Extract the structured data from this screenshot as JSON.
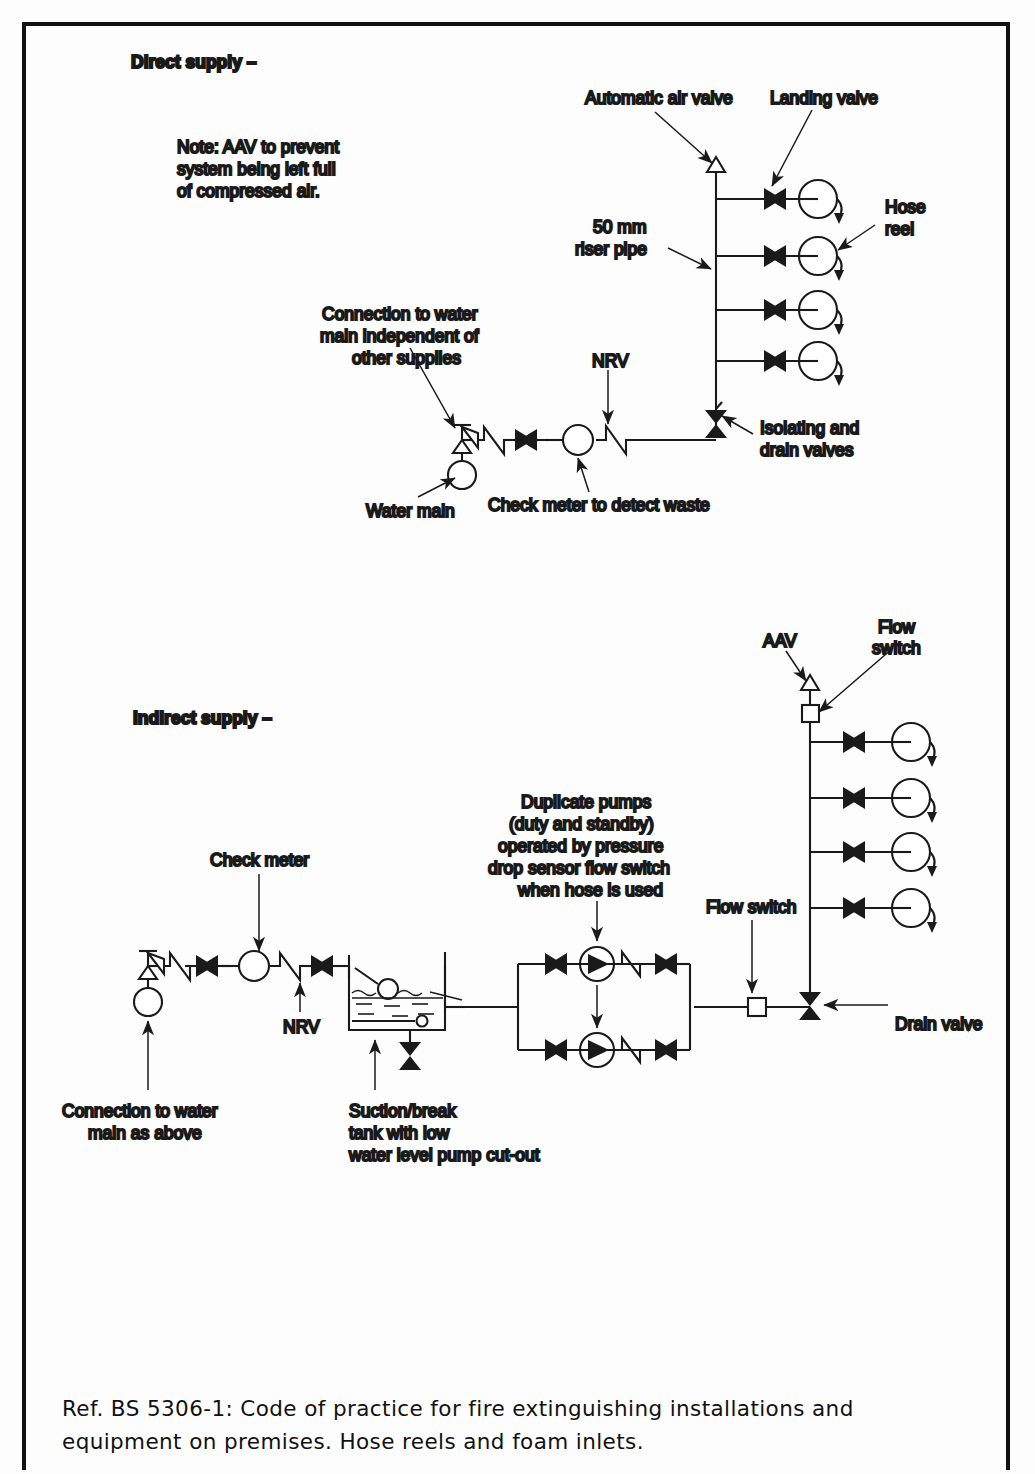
{
  "document": {
    "caption_line1": "Ref. BS 5306-1: Code of practice for fire extinguishing installations and",
    "caption_line2": "equipment on premises. Hose reels and foam inlets."
  },
  "diagram_direct": {
    "title": "Direct supply –",
    "note_line1": "Note: AAV to prevent",
    "note_line2": "system being left full",
    "note_line3": "of compressed air.",
    "label_aav": "Automatic air valve",
    "label_landing_valve": "Landing valve",
    "label_hose_reel_1": "Hose",
    "label_hose_reel_2": "reel",
    "label_riser_1": "50 mm",
    "label_riser_2": "riser pipe",
    "label_nrv": "NRV",
    "label_connection_1": "Connection to water",
    "label_connection_2": "main independent of",
    "label_connection_3": "other supplies",
    "label_water_main": "Water main",
    "label_check_meter": "Check meter to detect waste",
    "label_isolating_1": "Isolating and",
    "label_isolating_2": "drain valves",
    "hose_reel_count": 4
  },
  "diagram_indirect": {
    "title": "Indirect supply –",
    "label_aav": "AAV",
    "label_flow_switch_top_1": "Flow",
    "label_flow_switch_top_2": "switch",
    "label_flow_switch_mid": "Flow switch",
    "label_check_meter": "Check meter",
    "label_pumps_1": "Duplicate pumps",
    "label_pumps_2": "(duty and standby)",
    "label_pumps_3": "operated by pressure",
    "label_pumps_4": "drop sensor flow switch",
    "label_pumps_5": "when hose is used",
    "label_nrv": "NRV",
    "label_drain_valve": "Drain valve",
    "label_connection_1": "Connection to water",
    "label_connection_2": "main as above",
    "label_tank_1": "Suction/break",
    "label_tank_2": "tank with low",
    "label_tank_3": "water level pump cut-out",
    "hose_reel_count": 4,
    "pump_count": 2
  },
  "colors": {
    "line": "#1a1a1a",
    "text": "#1a1a1a",
    "background": "#fdfdfd",
    "border": "#111111"
  }
}
